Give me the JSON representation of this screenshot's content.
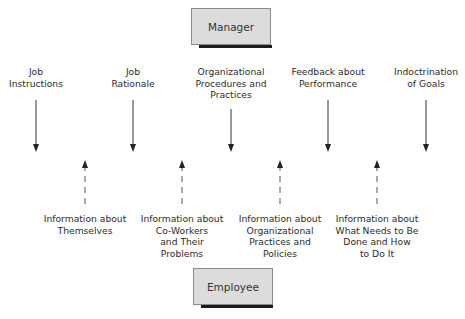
{
  "nodes": {
    "top": {
      "label": "Manager"
    },
    "bottom": {
      "label": "Employee"
    }
  },
  "downward": [
    {
      "lines": [
        "Job",
        "Instructions"
      ]
    },
    {
      "lines": [
        "Job",
        "Rationale"
      ]
    },
    {
      "lines": [
        "Organizational",
        "Procedures and",
        "Practices"
      ]
    },
    {
      "lines": [
        "Feedback about",
        "Performance"
      ]
    },
    {
      "lines": [
        "Indoctrination",
        "of Goals"
      ]
    }
  ],
  "upward": [
    {
      "lines": [
        "Information about",
        "Themselves"
      ]
    },
    {
      "lines": [
        "Information about",
        "Co-Workers",
        "and Their",
        "Problems"
      ]
    },
    {
      "lines": [
        "Information about",
        "Organizational",
        "Practices and",
        "Policies"
      ]
    },
    {
      "lines": [
        "Information about",
        "What Needs to Be",
        "Done and How",
        "to Do It"
      ]
    }
  ],
  "colors": {
    "box_fill": "#dcdcdc",
    "box_shadow": "#1c1c1c",
    "arrow_solid": "#333333",
    "arrow_dashed": "#555555"
  }
}
